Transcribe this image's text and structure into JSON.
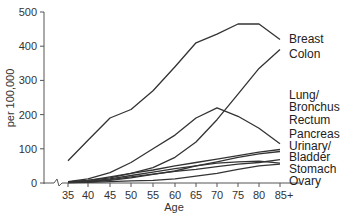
{
  "chart_data": {
    "type": "line",
    "title": "",
    "xlabel": "Age",
    "ylabel": "per 100,000",
    "ylim": [
      0,
      500
    ],
    "yticks": [
      0,
      100,
      200,
      300,
      400,
      500
    ],
    "grid": false,
    "legend_position": "right (inline labels at line ends)",
    "categories": [
      "35",
      "40",
      "45",
      "50",
      "55",
      "60",
      "65",
      "70",
      "75",
      "80",
      "85+"
    ],
    "series": [
      {
        "name": "Breast",
        "label_lines": [
          "Breast"
        ],
        "values": [
          65,
          125,
          190,
          215,
          270,
          340,
          410,
          435,
          465,
          465,
          420
        ]
      },
      {
        "name": "Colon",
        "label_lines": [
          "Colon"
        ],
        "values": [
          3,
          8,
          15,
          28,
          45,
          75,
          120,
          185,
          260,
          335,
          390
        ]
      },
      {
        "name": "Lung/Bronchus",
        "label_lines": [
          "Lung/",
          "Bronchus"
        ],
        "values": [
          4,
          12,
          30,
          60,
          100,
          140,
          190,
          220,
          195,
          160,
          115
        ]
      },
      {
        "name": "Rectum",
        "label_lines": [
          "Rectum"
        ],
        "values": [
          3,
          8,
          18,
          28,
          38,
          50,
          60,
          70,
          80,
          90,
          98
        ]
      },
      {
        "name": "Pancreas",
        "label_lines": [
          "Pancreas"
        ],
        "values": [
          1,
          3,
          8,
          15,
          25,
          35,
          50,
          62,
          75,
          85,
          92
        ]
      },
      {
        "name": "Urinary/Bladder",
        "label_lines": [
          "Urinary/",
          "Bladder"
        ],
        "values": [
          2,
          5,
          12,
          22,
          32,
          42,
          50,
          58,
          62,
          64,
          58
        ]
      },
      {
        "name": "Stomach",
        "label_lines": [
          "Stomach"
        ],
        "values": [
          2,
          5,
          10,
          18,
          26,
          34,
          40,
          48,
          55,
          60,
          68
        ]
      },
      {
        "name": "Ovary",
        "label_lines": [
          "Ovary"
        ],
        "values": [
          1,
          2,
          4,
          6,
          8,
          12,
          20,
          28,
          40,
          50,
          55
        ]
      }
    ]
  }
}
